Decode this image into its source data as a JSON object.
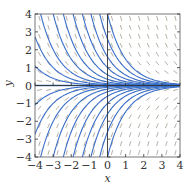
{
  "chart_data": {
    "type": "line",
    "subtype": "slope-field",
    "title": "",
    "equation": "dy/dx = -y",
    "solution_family": "y = C e^(-x)",
    "xlabel": "x",
    "ylabel": "y",
    "xlim": [
      -4,
      4
    ],
    "ylim": [
      -4,
      4
    ],
    "xticks": [
      -4,
      -3,
      -2,
      -1,
      0,
      1,
      2,
      3,
      4
    ],
    "yticks": [
      -4,
      -3,
      -2,
      -1,
      0,
      1,
      2,
      3,
      4
    ],
    "xtick_labels": [
      "−4",
      "−3",
      "−2",
      "−1",
      "0",
      "1",
      "2",
      "3",
      "4"
    ],
    "ytick_labels": [
      "−4",
      "−3",
      "−2",
      "−1",
      "0",
      "1",
      "2",
      "3",
      "4"
    ],
    "grid": false,
    "legend": null,
    "slope_segments": {
      "x_spacing": 0.5,
      "y_spacing": 0.5,
      "color": "#8a7a6a",
      "style": "dashed"
    },
    "series": [
      {
        "name": "C=0",
        "C": 0
      },
      {
        "name": "C=0.02",
        "C": 0.02
      },
      {
        "name": "C=0.05",
        "C": 0.05
      },
      {
        "name": "C=0.1",
        "C": 0.1
      },
      {
        "name": "C=0.2",
        "C": 0.2
      },
      {
        "name": "C=0.35",
        "C": 0.35
      },
      {
        "name": "C=0.6",
        "C": 0.6
      },
      {
        "name": "C=1",
        "C": 1
      },
      {
        "name": "C=1.6",
        "C": 1.6
      },
      {
        "name": "C=2.6",
        "C": 2.6
      },
      {
        "name": "C=4",
        "C": 4
      },
      {
        "name": "C=-0.02",
        "C": -0.02
      },
      {
        "name": "C=-0.05",
        "C": -0.05
      },
      {
        "name": "C=-0.1",
        "C": -0.1
      },
      {
        "name": "C=-0.2",
        "C": -0.2
      },
      {
        "name": "C=-0.35",
        "C": -0.35
      },
      {
        "name": "C=-0.6",
        "C": -0.6
      },
      {
        "name": "C=-1",
        "C": -1
      },
      {
        "name": "C=-1.6",
        "C": -1.6
      },
      {
        "name": "C=-2.6",
        "C": -2.6
      },
      {
        "name": "C=-4",
        "C": -4
      }
    ],
    "colors": {
      "curve": "#3a6fc8",
      "axis": "#333333",
      "frame": "#555555",
      "slope": "#8a7a6a"
    }
  }
}
